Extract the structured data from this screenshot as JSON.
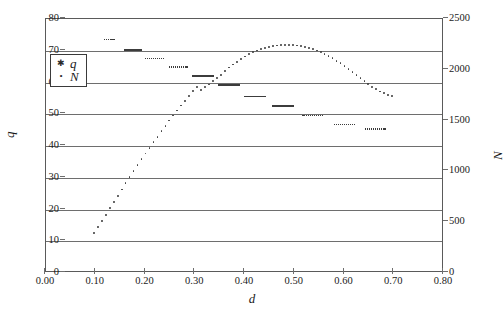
{
  "chart_data": {
    "type": "scatter",
    "title": "",
    "xlabel": "d",
    "ylabel": "q",
    "y2label": "N",
    "xlim": [
      0.0,
      0.8
    ],
    "ylim": [
      0,
      80
    ],
    "y2lim": [
      0,
      2500
    ],
    "grid": true,
    "legend_position": "upper-left",
    "xticks": [
      "0.00",
      "0.10",
      "0.20",
      "0.30",
      "0.40",
      "0.50",
      "0.60",
      "0.70",
      "0.80"
    ],
    "xtick_values": [
      0.0,
      0.1,
      0.2,
      0.3,
      0.4,
      0.5,
      0.6,
      0.7,
      0.8
    ],
    "yticks_left": [
      "0",
      "10",
      "20",
      "30",
      "40",
      "50",
      "60",
      "70",
      "80"
    ],
    "ytick_left_values": [
      0,
      10,
      20,
      30,
      40,
      50,
      60,
      70,
      80
    ],
    "yticks_right": [
      "0",
      "500",
      "1000",
      "1500",
      "2000",
      "2500"
    ],
    "ytick_right_values": [
      0,
      500,
      1000,
      1500,
      2000,
      2500
    ],
    "legend": [
      {
        "label": "q",
        "marker": "asterisk",
        "axis": "left"
      },
      {
        "label": "N",
        "marker": "dot",
        "axis": "right"
      }
    ],
    "series": [
      {
        "name": "q",
        "axis": "left",
        "marker": "asterisk",
        "color": "#3c3c3c",
        "points": [
          [
            0.118,
            73.6
          ],
          [
            0.122,
            73.6
          ],
          [
            0.126,
            73.6
          ],
          [
            0.13,
            73.6
          ],
          [
            0.133,
            73.6
          ],
          [
            0.137,
            73.6
          ],
          [
            0.159,
            70.2
          ],
          [
            0.163,
            70.2
          ],
          [
            0.167,
            70.2
          ],
          [
            0.171,
            70.2
          ],
          [
            0.175,
            70.2
          ],
          [
            0.179,
            70.2
          ],
          [
            0.183,
            70.2
          ],
          [
            0.187,
            70.2
          ],
          [
            0.191,
            70.2
          ],
          [
            0.2,
            67.6
          ],
          [
            0.204,
            67.6
          ],
          [
            0.208,
            67.6
          ],
          [
            0.212,
            67.6
          ],
          [
            0.216,
            67.6
          ],
          [
            0.22,
            67.6
          ],
          [
            0.224,
            67.6
          ],
          [
            0.228,
            67.6
          ],
          [
            0.232,
            67.6
          ],
          [
            0.236,
            67.6
          ],
          [
            0.248,
            64.8
          ],
          [
            0.252,
            64.8
          ],
          [
            0.256,
            64.8
          ],
          [
            0.26,
            64.8
          ],
          [
            0.264,
            64.8
          ],
          [
            0.268,
            64.8
          ],
          [
            0.272,
            64.8
          ],
          [
            0.276,
            64.8
          ],
          [
            0.28,
            64.8
          ],
          [
            0.284,
            64.8
          ],
          [
            0.296,
            62.0
          ],
          [
            0.3,
            62.0
          ],
          [
            0.304,
            62.0
          ],
          [
            0.308,
            62.0
          ],
          [
            0.312,
            62.0
          ],
          [
            0.316,
            62.0
          ],
          [
            0.32,
            62.0
          ],
          [
            0.324,
            62.0
          ],
          [
            0.328,
            62.0
          ],
          [
            0.332,
            62.0
          ],
          [
            0.336,
            62.0
          ],
          [
            0.348,
            59.2
          ],
          [
            0.352,
            59.2
          ],
          [
            0.356,
            59.2
          ],
          [
            0.36,
            59.2
          ],
          [
            0.364,
            59.2
          ],
          [
            0.368,
            59.2
          ],
          [
            0.372,
            59.2
          ],
          [
            0.376,
            59.2
          ],
          [
            0.38,
            59.2
          ],
          [
            0.384,
            59.2
          ],
          [
            0.388,
            59.2
          ],
          [
            0.4,
            55.6
          ],
          [
            0.404,
            55.6
          ],
          [
            0.408,
            55.6
          ],
          [
            0.412,
            55.6
          ],
          [
            0.416,
            55.6
          ],
          [
            0.42,
            55.6
          ],
          [
            0.424,
            55.6
          ],
          [
            0.428,
            55.6
          ],
          [
            0.432,
            55.6
          ],
          [
            0.436,
            55.6
          ],
          [
            0.44,
            55.6
          ],
          [
            0.456,
            52.6
          ],
          [
            0.46,
            52.6
          ],
          [
            0.464,
            52.6
          ],
          [
            0.468,
            52.6
          ],
          [
            0.472,
            52.6
          ],
          [
            0.476,
            52.6
          ],
          [
            0.48,
            52.6
          ],
          [
            0.484,
            52.6
          ],
          [
            0.488,
            52.6
          ],
          [
            0.492,
            52.6
          ],
          [
            0.496,
            52.6
          ],
          [
            0.516,
            49.6
          ],
          [
            0.52,
            49.6
          ],
          [
            0.524,
            49.6
          ],
          [
            0.528,
            49.6
          ],
          [
            0.532,
            49.6
          ],
          [
            0.536,
            49.6
          ],
          [
            0.54,
            49.6
          ],
          [
            0.544,
            49.6
          ],
          [
            0.548,
            49.6
          ],
          [
            0.552,
            49.6
          ],
          [
            0.556,
            49.6
          ],
          [
            0.58,
            46.8
          ],
          [
            0.584,
            46.8
          ],
          [
            0.588,
            46.8
          ],
          [
            0.592,
            46.8
          ],
          [
            0.596,
            46.8
          ],
          [
            0.6,
            46.8
          ],
          [
            0.604,
            46.8
          ],
          [
            0.608,
            46.8
          ],
          [
            0.612,
            46.8
          ],
          [
            0.616,
            46.8
          ],
          [
            0.62,
            46.8
          ],
          [
            0.642,
            45.4
          ],
          [
            0.646,
            45.4
          ],
          [
            0.65,
            45.4
          ],
          [
            0.654,
            45.4
          ],
          [
            0.658,
            45.4
          ],
          [
            0.662,
            45.4
          ],
          [
            0.666,
            45.4
          ],
          [
            0.67,
            45.4
          ],
          [
            0.674,
            45.4
          ],
          [
            0.678,
            45.4
          ],
          [
            0.682,
            45.4
          ]
        ]
      },
      {
        "name": "N",
        "axis": "right",
        "marker": "dot",
        "color": "#3c3c3c",
        "points": [
          [
            0.096,
            390
          ],
          [
            0.104,
            450
          ],
          [
            0.112,
            512
          ],
          [
            0.12,
            574
          ],
          [
            0.128,
            636
          ],
          [
            0.136,
            698
          ],
          [
            0.144,
            760
          ],
          [
            0.152,
            822
          ],
          [
            0.16,
            884
          ],
          [
            0.168,
            946
          ],
          [
            0.176,
            1004
          ],
          [
            0.184,
            1062
          ],
          [
            0.192,
            1120
          ],
          [
            0.2,
            1176
          ],
          [
            0.208,
            1232
          ],
          [
            0.216,
            1288
          ],
          [
            0.224,
            1342
          ],
          [
            0.232,
            1396
          ],
          [
            0.24,
            1448
          ],
          [
            0.248,
            1500
          ],
          [
            0.256,
            1550
          ],
          [
            0.264,
            1600
          ],
          [
            0.272,
            1648
          ],
          [
            0.28,
            1696
          ],
          [
            0.288,
            1742
          ],
          [
            0.296,
            1788
          ],
          [
            0.304,
            1830
          ],
          [
            0.312,
            1800
          ],
          [
            0.32,
            1828
          ],
          [
            0.328,
            1856
          ],
          [
            0.336,
            1886
          ],
          [
            0.344,
            1918
          ],
          [
            0.352,
            1952
          ],
          [
            0.36,
            1988
          ],
          [
            0.368,
            2022
          ],
          [
            0.376,
            2052
          ],
          [
            0.384,
            2080
          ],
          [
            0.392,
            2106
          ],
          [
            0.4,
            2130
          ],
          [
            0.408,
            2152
          ],
          [
            0.416,
            2172
          ],
          [
            0.424,
            2190
          ],
          [
            0.432,
            2204
          ],
          [
            0.44,
            2216
          ],
          [
            0.448,
            2226
          ],
          [
            0.456,
            2234
          ],
          [
            0.464,
            2240
          ],
          [
            0.472,
            2244
          ],
          [
            0.48,
            2246
          ],
          [
            0.488,
            2246
          ],
          [
            0.496,
            2244
          ],
          [
            0.504,
            2240
          ],
          [
            0.512,
            2234
          ],
          [
            0.52,
            2226
          ],
          [
            0.528,
            2216
          ],
          [
            0.536,
            2204
          ],
          [
            0.544,
            2190
          ],
          [
            0.552,
            2174
          ],
          [
            0.56,
            2156
          ],
          [
            0.568,
            2136
          ],
          [
            0.576,
            2114
          ],
          [
            0.584,
            2090
          ],
          [
            0.592,
            2064
          ],
          [
            0.6,
            2038
          ],
          [
            0.608,
            2010
          ],
          [
            0.616,
            1982
          ],
          [
            0.624,
            1952
          ],
          [
            0.632,
            1922
          ],
          [
            0.64,
            1892
          ],
          [
            0.648,
            1862
          ],
          [
            0.656,
            1834
          ],
          [
            0.664,
            1808
          ],
          [
            0.672,
            1786
          ],
          [
            0.68,
            1768
          ],
          [
            0.688,
            1754
          ],
          [
            0.696,
            1746
          ]
        ]
      }
    ]
  }
}
